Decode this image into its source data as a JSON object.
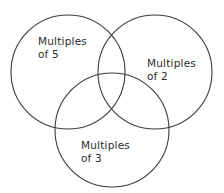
{
  "diagram": {
    "type": "venn-diagram",
    "set_count": 3,
    "background_color": "#ffffff",
    "stroke_color": "#3b3b3f",
    "text_color": "#2b2b2f",
    "sets": [
      {
        "id": "set-1",
        "label": "Multiples\nof 5",
        "label_line_1": "Multiples",
        "label_line_2": "of 5",
        "position": "top-left",
        "cx": 68,
        "cy": 72,
        "r": 57
      },
      {
        "id": "set-2",
        "label": "Multiples\nof 2",
        "label_line_1": "Multiples",
        "label_line_2": "of 2",
        "position": "top-right",
        "cx": 155,
        "cy": 72,
        "r": 57
      },
      {
        "id": "set-3",
        "label": "Multiples\nof 3",
        "label_line_1": "Multiples",
        "label_line_2": "of 3",
        "position": "bottom-center",
        "cx": 112,
        "cy": 130,
        "r": 57
      }
    ]
  }
}
